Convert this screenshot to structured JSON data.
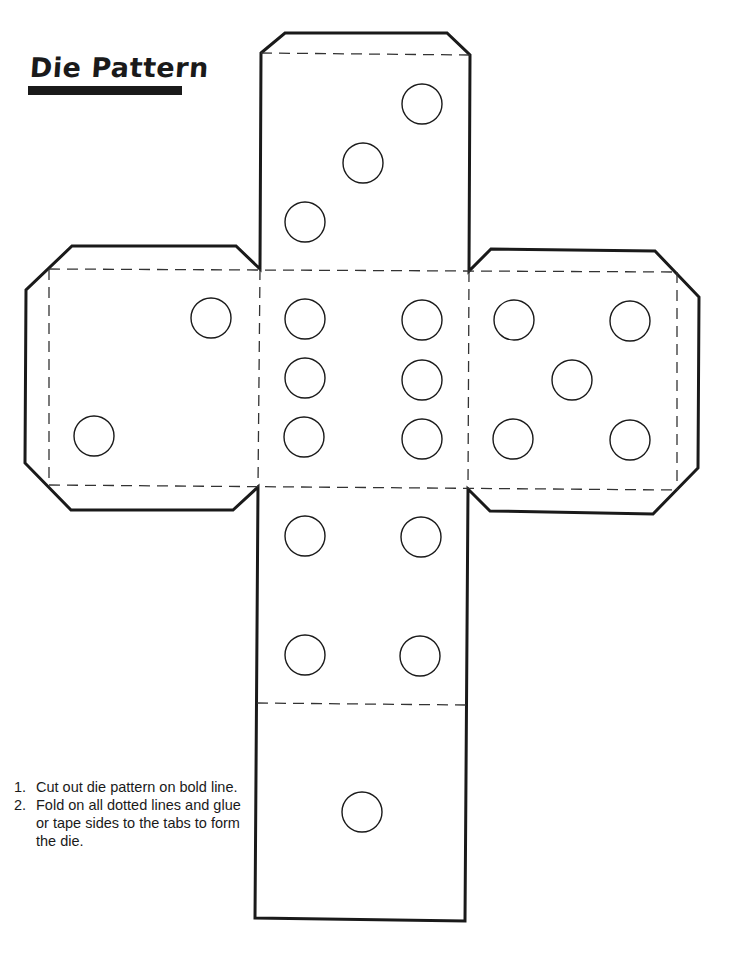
{
  "document": {
    "title": "Die Pattern",
    "instructions": [
      {
        "number": "1.",
        "text": "Cut out die pattern on bold line."
      },
      {
        "number": "2.",
        "text": "Fold on all dotted lines and glue or tape sides to the tabs to form the die."
      }
    ]
  },
  "pattern": {
    "faces": [
      {
        "name": "top-face",
        "pips": 3
      },
      {
        "name": "left-face",
        "pips": 2
      },
      {
        "name": "center-face",
        "pips": 6
      },
      {
        "name": "right-face",
        "pips": 5
      },
      {
        "name": "lower-face",
        "pips": 4
      },
      {
        "name": "bottom-face",
        "pips": 1
      }
    ],
    "line_color": "#1a1a1a",
    "fold_line_style": "dashed"
  }
}
